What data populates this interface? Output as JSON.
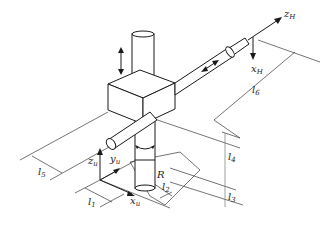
{
  "diagram": {
    "type": "cylindrical-robot-kinematic-schematic",
    "colors": {
      "line": "#1a1a1a",
      "background": "#ffffff"
    },
    "labels": {
      "zH": {
        "base": "z",
        "sub": "H"
      },
      "xH": {
        "base": "x",
        "sub": "H"
      },
      "zu": {
        "base": "z",
        "sub": "u"
      },
      "yu": {
        "base": "y",
        "sub": "u"
      },
      "xu": {
        "base": "x",
        "sub": "u"
      },
      "R": "R",
      "l1": {
        "base": "l",
        "sub": "1"
      },
      "l2": {
        "base": "l",
        "sub": "2"
      },
      "l3": {
        "base": "l",
        "sub": "3"
      },
      "l4": {
        "base": "l",
        "sub": "4"
      },
      "l5": {
        "base": "l",
        "sub": "5"
      },
      "l6": {
        "base": "l",
        "sub": "6"
      }
    },
    "icons": {
      "vertical-motion": "double-arrow-up-down",
      "horizontal-motion": "double-arrow-diagonal",
      "rotation": "curved-arrow-rotation"
    }
  }
}
